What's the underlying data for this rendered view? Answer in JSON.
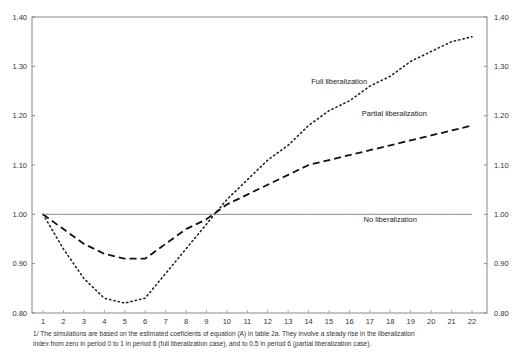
{
  "chart_data": {
    "type": "line",
    "title": "",
    "xlabel": "",
    "ylabel": "",
    "categories": [
      1,
      2,
      3,
      4,
      5,
      6,
      7,
      8,
      9,
      10,
      11,
      12,
      13,
      14,
      15,
      16,
      17,
      18,
      19,
      20,
      21,
      22
    ],
    "ylim": [
      0.8,
      1.4
    ],
    "yticks": [
      "0.80",
      "0.90",
      "1.00",
      "1.10",
      "1.20",
      "1.30",
      "1.40"
    ],
    "y_axis_both_sides": true,
    "grid": false,
    "series": [
      {
        "name": "Full liberalization",
        "style": "dotted",
        "values": [
          1.0,
          0.93,
          0.87,
          0.83,
          0.82,
          0.83,
          0.88,
          0.93,
          0.98,
          1.03,
          1.07,
          1.11,
          1.14,
          1.18,
          1.21,
          1.23,
          1.26,
          1.28,
          1.31,
          1.33,
          1.35,
          1.36
        ]
      },
      {
        "name": "Partial liberalization",
        "style": "dashed",
        "values": [
          1.0,
          0.97,
          0.94,
          0.92,
          0.91,
          0.91,
          0.94,
          0.97,
          0.99,
          1.02,
          1.04,
          1.06,
          1.08,
          1.1,
          1.11,
          1.12,
          1.13,
          1.14,
          1.15,
          1.16,
          1.17,
          1.18
        ]
      },
      {
        "name": "No liberalization",
        "style": "solid",
        "values": [
          1.0,
          1.0,
          1.0,
          1.0,
          1.0,
          1.0,
          1.0,
          1.0,
          1.0,
          1.0,
          1.0,
          1.0,
          1.0,
          1.0,
          1.0,
          1.0,
          1.0,
          1.0,
          1.0,
          1.0,
          1.0,
          1.0
        ]
      }
    ],
    "annotations": [
      {
        "text": "Full liberalization",
        "x": 15.5,
        "y": 1.265
      },
      {
        "text": "Partial liberalization",
        "x": 18.2,
        "y": 1.2
      },
      {
        "text": "No liberalization",
        "x": 18.0,
        "y": 0.985
      }
    ]
  },
  "footnote": {
    "line1": "1/  The simulations are based on the estimated coeficients of equation (A) in table 2a.  They involve a steady rise in the liberalization",
    "line2": "index from zero in period 0 to 1 in period 6 (full liberalization case), and to 0.5 in period 6 (partial liberalization case)."
  }
}
